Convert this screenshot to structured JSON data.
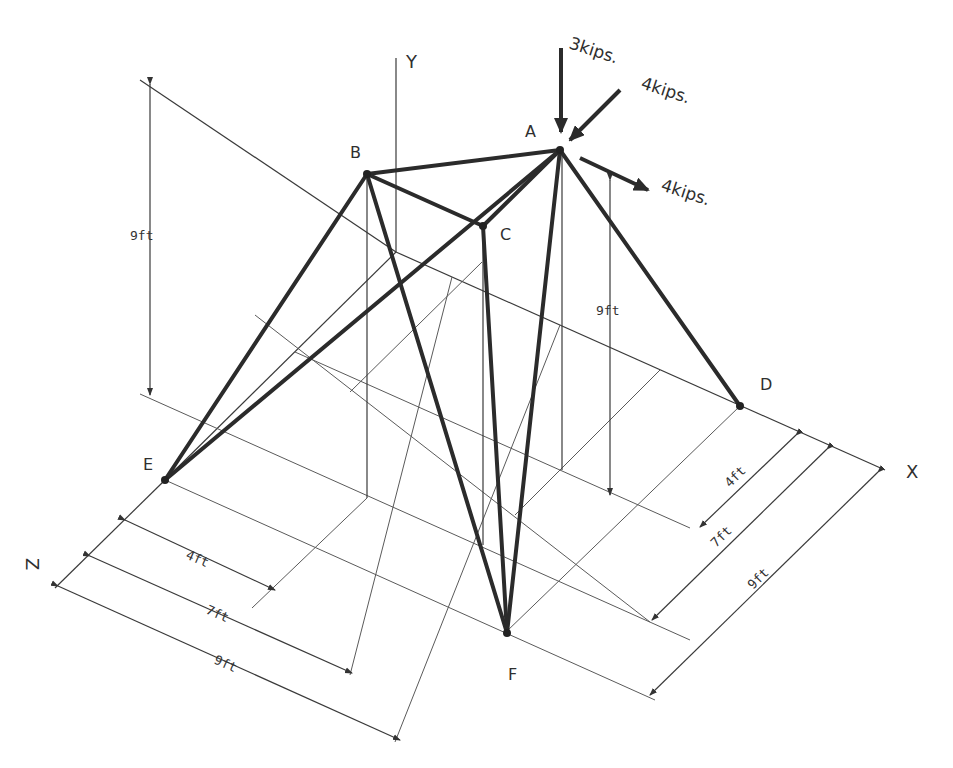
{
  "diagram": {
    "type": "3D space truss (isometric)",
    "axes": {
      "x": "X",
      "y": "Y",
      "z": "Z"
    },
    "nodes": {
      "A": "A",
      "B": "B",
      "C": "C",
      "D": "D",
      "E": "E",
      "F": "F"
    },
    "loads": [
      {
        "label": "3kips.",
        "direction": "-Y",
        "node": "A"
      },
      {
        "label": "4kips.",
        "direction": "-X toward A",
        "node": "A"
      },
      {
        "label": "4kips.",
        "direction": "+X away from A",
        "node": "A"
      }
    ],
    "dimensions": {
      "height_left": "9ft",
      "height_right": "9ft",
      "bottom": [
        "4ft",
        "7ft",
        "9ft"
      ],
      "right": [
        "4ft",
        "7ft",
        "9ft"
      ]
    },
    "members": [
      "AB",
      "AC",
      "AD",
      "AE",
      "AF",
      "BC",
      "BE",
      "BF",
      "CF"
    ],
    "colors": {
      "member": "#2b2b2b",
      "line": "#3a3a3a",
      "background": "#ffffff"
    }
  }
}
